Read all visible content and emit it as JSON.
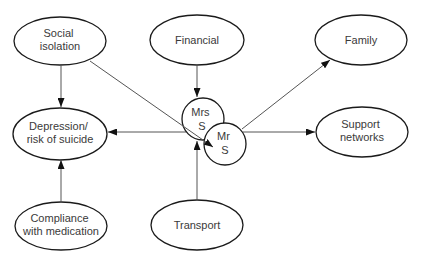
{
  "diagram": {
    "nodes": {
      "social_isolation": {
        "line1": "Social",
        "line2": "isolation"
      },
      "financial": {
        "line1": "Financial"
      },
      "family": {
        "line1": "Family"
      },
      "depression": {
        "line1": "Depression/",
        "line2": "risk of suicide"
      },
      "support_networks": {
        "line1": "Support",
        "line2": "networks"
      },
      "compliance": {
        "line1": "Compliance",
        "line2": "with medication"
      },
      "transport": {
        "line1": "Transport"
      },
      "mrs_s": {
        "line1": "Mrs",
        "line2": "S"
      },
      "mr_s": {
        "line1": "Mr",
        "line2": "S"
      }
    },
    "edges": [
      {
        "from": "social_isolation",
        "to": "depression"
      },
      {
        "from": "social_isolation",
        "to": "mr_s"
      },
      {
        "from": "financial",
        "to": "mrs_s"
      },
      {
        "from": "transport",
        "to": "mrs_s"
      },
      {
        "from": "compliance",
        "to": "depression"
      },
      {
        "from": "mrs_s",
        "to": "depression"
      },
      {
        "from": "mr_s",
        "to": "family"
      },
      {
        "from": "mr_s",
        "to": "support_networks"
      }
    ],
    "colors": {
      "background": "#ffffff",
      "node_stroke": "#1a1a1a",
      "edge_stroke": "#555555",
      "arrowhead": "#111111",
      "text": "#3a3a3a"
    }
  }
}
